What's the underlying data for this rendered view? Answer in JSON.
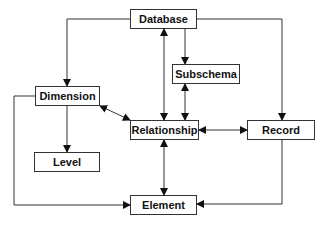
{
  "diagram": {
    "nodes": [
      {
        "id": "database",
        "label": "Database"
      },
      {
        "id": "subschema",
        "label": "Subschema"
      },
      {
        "id": "dimension",
        "label": "Dimension"
      },
      {
        "id": "relationship",
        "label": "Relationship"
      },
      {
        "id": "record",
        "label": "Record"
      },
      {
        "id": "level",
        "label": "Level"
      },
      {
        "id": "element",
        "label": "Element"
      }
    ],
    "edges": [
      {
        "from": "database",
        "to": "dimension",
        "type": "directed"
      },
      {
        "from": "database",
        "to": "subschema",
        "type": "directed"
      },
      {
        "from": "database",
        "to": "record",
        "type": "directed"
      },
      {
        "from": "database",
        "to": "relationship",
        "type": "bidirectional"
      },
      {
        "from": "subschema",
        "to": "relationship",
        "type": "bidirectional"
      },
      {
        "from": "dimension",
        "to": "relationship",
        "type": "bidirectional"
      },
      {
        "from": "dimension",
        "to": "level",
        "type": "directed"
      },
      {
        "from": "dimension",
        "to": "element",
        "type": "directed"
      },
      {
        "from": "relationship",
        "to": "record",
        "type": "bidirectional"
      },
      {
        "from": "relationship",
        "to": "element",
        "type": "bidirectional"
      },
      {
        "from": "record",
        "to": "element",
        "type": "directed"
      }
    ]
  }
}
